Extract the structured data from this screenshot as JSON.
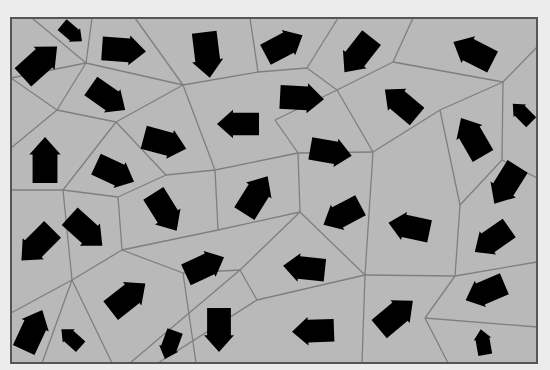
{
  "diagram": {
    "type": "voronoi-vector-field",
    "background": "#ececec",
    "frame": {
      "x": 11,
      "y": 18,
      "width": 526,
      "height": 345,
      "fill": "#b9b9b9",
      "stroke": "#555555"
    },
    "edge_color": "#7f7f7f",
    "arrow_color": "#000000",
    "edges": [
      [
        [
          32,
          18
        ],
        [
          86,
          63
        ]
      ],
      [
        [
          86,
          63
        ],
        [
          92,
          18
        ]
      ],
      [
        [
          86,
          63
        ],
        [
          11,
          78
        ]
      ],
      [
        [
          86,
          63
        ],
        [
          57,
          110
        ]
      ],
      [
        [
          86,
          63
        ],
        [
          183,
          85
        ]
      ],
      [
        [
          11,
          78
        ],
        [
          57,
          110
        ]
      ],
      [
        [
          57,
          110
        ],
        [
          11,
          148
        ]
      ],
      [
        [
          57,
          110
        ],
        [
          116,
          122
        ]
      ],
      [
        [
          116,
          122
        ],
        [
          183,
          85
        ]
      ],
      [
        [
          183,
          85
        ],
        [
          135,
          18
        ]
      ],
      [
        [
          183,
          85
        ],
        [
          258,
          72
        ]
      ],
      [
        [
          258,
          72
        ],
        [
          250,
          18
        ]
      ],
      [
        [
          258,
          72
        ],
        [
          307,
          68
        ]
      ],
      [
        [
          307,
          68
        ],
        [
          338,
          18
        ]
      ],
      [
        [
          307,
          68
        ],
        [
          337,
          90
        ]
      ],
      [
        [
          337,
          90
        ],
        [
          393,
          62
        ]
      ],
      [
        [
          393,
          62
        ],
        [
          413,
          18
        ]
      ],
      [
        [
          393,
          62
        ],
        [
          503,
          82
        ]
      ],
      [
        [
          503,
          82
        ],
        [
          537,
          47
        ]
      ],
      [
        [
          337,
          90
        ],
        [
          373,
          152
        ]
      ],
      [
        [
          183,
          85
        ],
        [
          215,
          170
        ]
      ],
      [
        [
          116,
          122
        ],
        [
          63,
          190
        ]
      ],
      [
        [
          116,
          122
        ],
        [
          166,
          175
        ]
      ],
      [
        [
          166,
          175
        ],
        [
          215,
          170
        ]
      ],
      [
        [
          215,
          170
        ],
        [
          218,
          230
        ]
      ],
      [
        [
          215,
          170
        ],
        [
          298,
          153
        ]
      ],
      [
        [
          298,
          153
        ],
        [
          275,
          120
        ]
      ],
      [
        [
          275,
          120
        ],
        [
          337,
          90
        ]
      ],
      [
        [
          298,
          153
        ],
        [
          373,
          152
        ]
      ],
      [
        [
          373,
          152
        ],
        [
          440,
          110
        ]
      ],
      [
        [
          440,
          110
        ],
        [
          503,
          82
        ]
      ],
      [
        [
          503,
          82
        ],
        [
          502,
          160
        ]
      ],
      [
        [
          440,
          110
        ],
        [
          460,
          205
        ]
      ],
      [
        [
          502,
          160
        ],
        [
          460,
          205
        ]
      ],
      [
        [
          502,
          160
        ],
        [
          537,
          178
        ]
      ],
      [
        [
          11,
          190
        ],
        [
          63,
          190
        ]
      ],
      [
        [
          63,
          190
        ],
        [
          118,
          197
        ]
      ],
      [
        [
          118,
          197
        ],
        [
          166,
          175
        ]
      ],
      [
        [
          118,
          197
        ],
        [
          122,
          250
        ]
      ],
      [
        [
          122,
          250
        ],
        [
          218,
          230
        ]
      ],
      [
        [
          218,
          230
        ],
        [
          300,
          212
        ]
      ],
      [
        [
          300,
          212
        ],
        [
          298,
          153
        ]
      ],
      [
        [
          300,
          212
        ],
        [
          365,
          275
        ]
      ],
      [
        [
          373,
          152
        ],
        [
          365,
          275
        ]
      ],
      [
        [
          300,
          212
        ],
        [
          240,
          270
        ]
      ],
      [
        [
          63,
          190
        ],
        [
          72,
          280
        ]
      ],
      [
        [
          122,
          250
        ],
        [
          72,
          280
        ]
      ],
      [
        [
          72,
          280
        ],
        [
          11,
          313
        ]
      ],
      [
        [
          72,
          280
        ],
        [
          42,
          363
        ]
      ],
      [
        [
          72,
          280
        ],
        [
          112,
          363
        ]
      ],
      [
        [
          122,
          250
        ],
        [
          183,
          273
        ]
      ],
      [
        [
          183,
          273
        ],
        [
          240,
          270
        ]
      ],
      [
        [
          183,
          273
        ],
        [
          196,
          363
        ]
      ],
      [
        [
          240,
          270
        ],
        [
          130,
          363
        ]
      ],
      [
        [
          365,
          275
        ],
        [
          257,
          300
        ]
      ],
      [
        [
          257,
          300
        ],
        [
          240,
          270
        ]
      ],
      [
        [
          257,
          300
        ],
        [
          158,
          363
        ]
      ],
      [
        [
          365,
          275
        ],
        [
          455,
          276
        ]
      ],
      [
        [
          455,
          276
        ],
        [
          460,
          205
        ]
      ],
      [
        [
          455,
          276
        ],
        [
          537,
          262
        ]
      ],
      [
        [
          455,
          276
        ],
        [
          425,
          318
        ]
      ],
      [
        [
          425,
          318
        ],
        [
          537,
          327
        ]
      ],
      [
        [
          425,
          318
        ],
        [
          448,
          363
        ]
      ],
      [
        [
          365,
          275
        ],
        [
          362,
          363
        ]
      ],
      [
        [
          11,
          148
        ],
        [
          11,
          190
        ]
      ]
    ],
    "arrows": [
      {
        "cx": 40,
        "cy": 62,
        "angle": -42,
        "len": 46
      },
      {
        "cx": 72,
        "cy": 33,
        "angle": 40,
        "len": 26
      },
      {
        "cx": 124,
        "cy": 50,
        "angle": 4,
        "len": 44
      },
      {
        "cx": 207,
        "cy": 55,
        "angle": 83,
        "len": 46
      },
      {
        "cx": 284,
        "cy": 45,
        "angle": -28,
        "len": 42
      },
      {
        "cx": 358,
        "cy": 55,
        "angle": 128,
        "len": 44
      },
      {
        "cx": 473,
        "cy": 52,
        "angle": -153,
        "len": 44
      },
      {
        "cx": 108,
        "cy": 98,
        "angle": 35,
        "len": 42
      },
      {
        "cx": 238,
        "cy": 124,
        "angle": 180,
        "len": 42
      },
      {
        "cx": 302,
        "cy": 98,
        "angle": 3,
        "len": 44
      },
      {
        "cx": 401,
        "cy": 103,
        "angle": -140,
        "len": 42
      },
      {
        "cx": 522,
        "cy": 113,
        "angle": -135,
        "len": 26
      },
      {
        "cx": 45,
        "cy": 160,
        "angle": -90,
        "len": 46
      },
      {
        "cx": 165,
        "cy": 143,
        "angle": 15,
        "len": 44
      },
      {
        "cx": 115,
        "cy": 173,
        "angle": 25,
        "len": 42
      },
      {
        "cx": 331,
        "cy": 152,
        "angle": 10,
        "len": 42
      },
      {
        "cx": 472,
        "cy": 137,
        "angle": -120,
        "len": 44
      },
      {
        "cx": 256,
        "cy": 195,
        "angle": -58,
        "len": 44
      },
      {
        "cx": 506,
        "cy": 185,
        "angle": 122,
        "len": 44
      },
      {
        "cx": 37,
        "cy": 245,
        "angle": 135,
        "len": 44
      },
      {
        "cx": 86,
        "cy": 231,
        "angle": 42,
        "len": 44
      },
      {
        "cx": 165,
        "cy": 212,
        "angle": 58,
        "len": 44
      },
      {
        "cx": 342,
        "cy": 215,
        "angle": 152,
        "len": 42
      },
      {
        "cx": 409,
        "cy": 227,
        "angle": -168,
        "len": 42
      },
      {
        "cx": 492,
        "cy": 240,
        "angle": 145,
        "len": 42
      },
      {
        "cx": 205,
        "cy": 266,
        "angle": -25,
        "len": 42
      },
      {
        "cx": 304,
        "cy": 268,
        "angle": -174,
        "len": 42
      },
      {
        "cx": 485,
        "cy": 292,
        "angle": 157,
        "len": 42
      },
      {
        "cx": 128,
        "cy": 297,
        "angle": -38,
        "len": 44
      },
      {
        "cx": 33,
        "cy": 330,
        "angle": -65,
        "len": 44
      },
      {
        "cx": 71,
        "cy": 338,
        "angle": -138,
        "len": 26
      },
      {
        "cx": 170,
        "cy": 345,
        "angle": 110,
        "len": 30
      },
      {
        "cx": 219,
        "cy": 330,
        "angle": 90,
        "len": 44
      },
      {
        "cx": 313,
        "cy": 331,
        "angle": 178,
        "len": 42
      },
      {
        "cx": 396,
        "cy": 315,
        "angle": -40,
        "len": 44
      },
      {
        "cx": 483,
        "cy": 342,
        "angle": -100,
        "len": 26
      }
    ]
  }
}
